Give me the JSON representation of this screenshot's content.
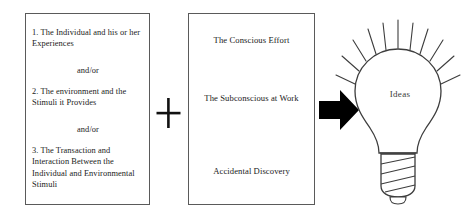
{
  "diagram": {
    "background_color": "#ffffff",
    "line_color": "#5a5a5a",
    "arrow_color": "#000000",
    "text_color": "#1a1a1a"
  },
  "input_box": {
    "name": "Inputs",
    "lines": [
      "1.  The Individual and his or her Experiences",
      "and/or",
      "2.  The environment and the Stimuli it Provides",
      "and/or",
      "3.  The Transaction and Interaction Between the Individual and Environmental Stimuli"
    ]
  },
  "operator": {
    "symbol": "+",
    "label": "plus"
  },
  "process_box": {
    "name": "Process",
    "lines": [
      "The Conscious Effort",
      "The Subconscious at Work",
      "Accidental Discovery"
    ]
  },
  "arrow": {
    "label": "leads to",
    "direction": "right"
  },
  "outcome": {
    "label": "Ideas",
    "icon": "lightbulb-icon",
    "ray_count": 11
  }
}
